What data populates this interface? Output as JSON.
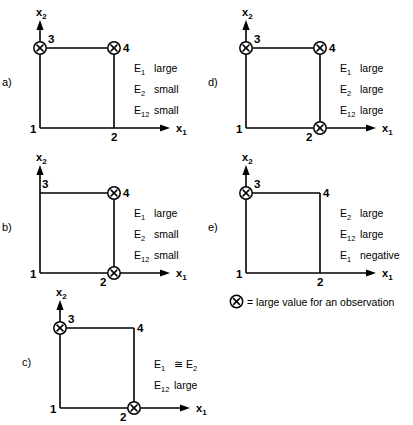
{
  "figure": {
    "marker_glyph": "X",
    "legend": {
      "text": "= large value for an observation",
      "marker_name": "circled-x"
    },
    "axis": {
      "x_label": "x",
      "x_sub": "1",
      "y_label": "x",
      "y_sub": "2"
    },
    "corners": {
      "origin": "1",
      "bottom_right": "2",
      "top_left": "3",
      "top_right": "4"
    }
  },
  "panels": [
    {
      "letter": "a)",
      "marked": [
        "3",
        "4"
      ],
      "effects": [
        {
          "sym": "E",
          "sub": "1",
          "desc": "large"
        },
        {
          "sym": "E",
          "sub": "2",
          "desc": "small"
        },
        {
          "sym": "E",
          "sub": "12",
          "desc": "small"
        }
      ]
    },
    {
      "letter": "b)",
      "marked": [
        "4",
        "2"
      ],
      "effects": [
        {
          "sym": "E",
          "sub": "1",
          "desc": "large"
        },
        {
          "sym": "E",
          "sub": "2",
          "desc": "small"
        },
        {
          "sym": "E",
          "sub": "12",
          "desc": "small"
        }
      ]
    },
    {
      "letter": "c)",
      "marked": [
        "3",
        "2"
      ],
      "effects": [
        {
          "sym": "E",
          "sub": "1",
          "desc": "≅ E",
          "desc_sub": "2"
        },
        {
          "sym": "E",
          "sub": "12",
          "desc": "large"
        }
      ]
    },
    {
      "letter": "d)",
      "marked": [
        "3",
        "4",
        "2"
      ],
      "effects": [
        {
          "sym": "E",
          "sub": "1",
          "desc": "large"
        },
        {
          "sym": "E",
          "sub": "2",
          "desc": "large"
        },
        {
          "sym": "E",
          "sub": "12",
          "desc": "large"
        }
      ]
    },
    {
      "letter": "e)",
      "marked": [
        "3"
      ],
      "effects": [
        {
          "sym": "E",
          "sub": "2",
          "desc": "large"
        },
        {
          "sym": "E",
          "sub": "12",
          "desc": "large"
        },
        {
          "sym": "E",
          "sub": "1",
          "desc": "negative"
        }
      ]
    }
  ]
}
